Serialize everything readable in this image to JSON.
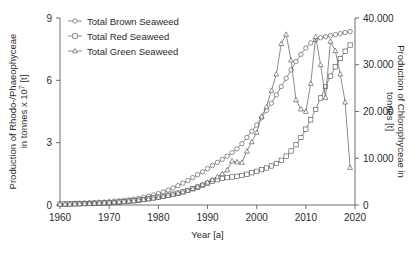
{
  "chart_data": {
    "type": "line",
    "title": "",
    "xlabel": "Year [a]",
    "ylabel": "Production of Rhodo-/Phaeophyceae in tonnes x 10⁷ [t]",
    "ylabel_left_line1": "Production of Rhodo-/Phaeophyceae",
    "ylabel_left_line2": "in tonnes x 10",
    "ylabel_left_exponent": "7",
    "ylabel_left_unit": " [t]",
    "ylabel_right": "Production of Chlorophyceae in tonnes [t]",
    "ylabel_right_line1": "Production of Chlorophyceae in",
    "ylabel_right_line2": "tonnes [t]",
    "xlim": [
      1960,
      2020
    ],
    "ylim_left": [
      0,
      9
    ],
    "ylim_right": [
      0,
      40000
    ],
    "xticks": [
      "1960",
      "1970",
      "1980",
      "1990",
      "2000",
      "2010",
      "2020"
    ],
    "xtick_values": [
      1960,
      1970,
      1980,
      1990,
      2000,
      2010,
      2020
    ],
    "yticks_left": [
      "0",
      "3",
      "6",
      "9"
    ],
    "ytick_values_left": [
      0,
      3,
      6,
      9
    ],
    "yticks_right": [
      "0",
      "10.000",
      "20.000",
      "30.000",
      "40.000"
    ],
    "ytick_values_right": [
      0,
      10000,
      20000,
      30000,
      40000
    ],
    "grid": false,
    "legend_position": "top-left",
    "series": [
      {
        "name": "Total Brown Seaweed",
        "marker": "circle",
        "axis": "left",
        "x": [
          1960,
          1961,
          1962,
          1963,
          1964,
          1965,
          1966,
          1967,
          1968,
          1969,
          1970,
          1971,
          1972,
          1973,
          1974,
          1975,
          1976,
          1977,
          1978,
          1979,
          1980,
          1981,
          1982,
          1983,
          1984,
          1985,
          1986,
          1987,
          1988,
          1989,
          1990,
          1991,
          1992,
          1993,
          1994,
          1995,
          1996,
          1997,
          1998,
          1999,
          2000,
          2001,
          2002,
          2003,
          2004,
          2005,
          2006,
          2007,
          2008,
          2009,
          2010,
          2011,
          2012,
          2013,
          2014,
          2015,
          2016,
          2017,
          2018,
          2019
        ],
        "values": [
          0.05,
          0.06,
          0.07,
          0.08,
          0.09,
          0.1,
          0.11,
          0.12,
          0.13,
          0.14,
          0.16,
          0.18,
          0.2,
          0.22,
          0.25,
          0.28,
          0.32,
          0.37,
          0.42,
          0.48,
          0.55,
          0.63,
          0.72,
          0.82,
          0.93,
          1.05,
          1.18,
          1.32,
          1.46,
          1.6,
          1.75,
          1.9,
          2.05,
          2.2,
          2.35,
          2.52,
          2.7,
          2.95,
          3.25,
          3.55,
          3.85,
          4.2,
          4.55,
          4.9,
          5.3,
          5.7,
          6.1,
          6.5,
          6.9,
          7.25,
          7.55,
          7.8,
          7.95,
          8.05,
          8.1,
          8.15,
          8.2,
          8.25,
          8.3,
          8.35
        ]
      },
      {
        "name": "Total Red Seaweed",
        "marker": "square",
        "axis": "left",
        "x": [
          1960,
          1961,
          1962,
          1963,
          1964,
          1965,
          1966,
          1967,
          1968,
          1969,
          1970,
          1971,
          1972,
          1973,
          1974,
          1975,
          1976,
          1977,
          1978,
          1979,
          1980,
          1981,
          1982,
          1983,
          1984,
          1985,
          1986,
          1987,
          1988,
          1989,
          1990,
          1991,
          1992,
          1993,
          1994,
          1995,
          1996,
          1997,
          1998,
          1999,
          2000,
          2001,
          2002,
          2003,
          2004,
          2005,
          2006,
          2007,
          2008,
          2009,
          2010,
          2011,
          2012,
          2013,
          2014,
          2015,
          2016,
          2017,
          2018,
          2019
        ],
        "values": [
          0.04,
          0.045,
          0.05,
          0.055,
          0.06,
          0.065,
          0.07,
          0.08,
          0.09,
          0.1,
          0.11,
          0.12,
          0.14,
          0.16,
          0.18,
          0.2,
          0.23,
          0.26,
          0.3,
          0.34,
          0.38,
          0.42,
          0.47,
          0.52,
          0.57,
          0.63,
          0.7,
          0.78,
          0.86,
          0.95,
          1.05,
          1.15,
          1.22,
          1.28,
          1.32,
          1.35,
          1.38,
          1.42,
          1.48,
          1.55,
          1.62,
          1.7,
          1.78,
          1.88,
          2.0,
          2.15,
          2.35,
          2.6,
          2.9,
          3.25,
          3.65,
          4.1,
          4.6,
          5.15,
          5.7,
          6.2,
          6.65,
          7.05,
          7.4,
          7.7
        ]
      },
      {
        "name": "Total Green Seaweed",
        "marker": "triangle",
        "axis": "right",
        "x": [
          1960,
          1961,
          1962,
          1963,
          1964,
          1965,
          1966,
          1967,
          1968,
          1969,
          1970,
          1971,
          1972,
          1973,
          1974,
          1975,
          1976,
          1977,
          1978,
          1979,
          1980,
          1981,
          1982,
          1983,
          1984,
          1985,
          1986,
          1987,
          1988,
          1989,
          1990,
          1991,
          1992,
          1993,
          1994,
          1995,
          1996,
          1997,
          1998,
          1999,
          2000,
          2001,
          2002,
          2003,
          2004,
          2005,
          2006,
          2007,
          2008,
          2009,
          2010,
          2011,
          2012,
          2013,
          2014,
          2015,
          2016,
          2017,
          2018,
          2019
        ],
        "values": [
          150,
          180,
          200,
          230,
          260,
          300,
          340,
          380,
          430,
          480,
          540,
          600,
          680,
          760,
          850,
          950,
          1060,
          1180,
          1320,
          1470,
          1640,
          1830,
          2040,
          2270,
          2530,
          2820,
          3140,
          3500,
          3900,
          4350,
          4850,
          5400,
          6020,
          6700,
          7500,
          9400,
          9200,
          9100,
          11500,
          13500,
          15500,
          19000,
          21000,
          24500,
          28000,
          34500,
          36500,
          31000,
          22500,
          20500,
          20000,
          26000,
          36000,
          30000,
          23000,
          35000,
          33000,
          28000,
          22000,
          8000
        ]
      }
    ],
    "legend": [
      {
        "label": "Total Brown Seaweed",
        "marker": "circle"
      },
      {
        "label": "Total Red Seaweed",
        "marker": "square"
      },
      {
        "label": "Total Green Seaweed",
        "marker": "triangle"
      }
    ]
  },
  "colors": {
    "line": "#5a5a5a",
    "marker_stroke": "#4a4a4a",
    "marker_fill": "#ffffff",
    "axis": "#6e6e6e",
    "text": "#2b2b2b",
    "background": "#ffffff"
  }
}
